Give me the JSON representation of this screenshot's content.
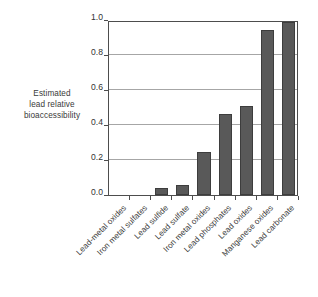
{
  "chart_data": {
    "type": "bar",
    "title": "",
    "subtitle": "",
    "xlabel": "",
    "ylabel": "Estimated lead relative bioaccessibility",
    "ylabel_lines": [
      "Estimated",
      "lead relative",
      "bioaccessibility"
    ],
    "categories": [
      "Lead-metal oxides",
      "Iron metal sulfates",
      "Lead sulfide",
      "Lead sulfate",
      "Iron metal oxides",
      "Lead phosphates",
      "Lead oxides",
      "Manganese oxides",
      "Lead carbonate"
    ],
    "values": [
      0.0,
      0.0,
      0.04,
      0.055,
      0.245,
      0.465,
      0.51,
      0.945,
      0.99
    ],
    "ylim": [
      0.0,
      1.0
    ],
    "ytick_values": [
      0.0,
      0.2,
      0.4,
      0.6,
      0.8,
      1.0
    ],
    "ytick_labels": [
      "0.0",
      "0.2",
      "0.4",
      "0.6",
      "0.8",
      "1.0"
    ],
    "grid": true,
    "grid_axis": "y",
    "legend": false,
    "legend_position": "none",
    "bar_color": "#595959",
    "bar_edge_color": "#3d3d3d",
    "grid_color": "#a6a6a6",
    "frame_color": "#4d4d4d",
    "text_color": "#3a3a3a",
    "background_color": "#ffffff",
    "xtick_label_rotation": -45,
    "annotations": []
  }
}
